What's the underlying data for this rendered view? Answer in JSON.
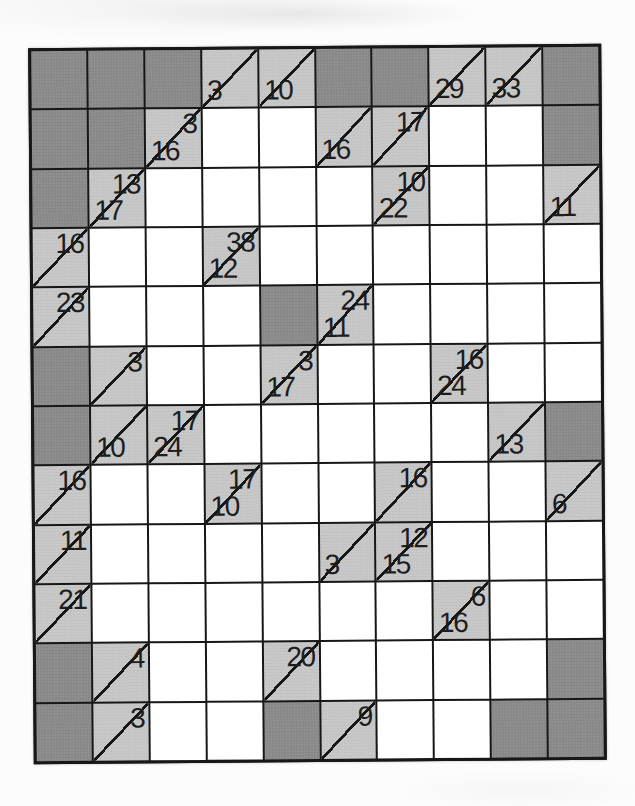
{
  "puzzle": {
    "type": "kakuro",
    "rows": 12,
    "cols": 10,
    "colors": {
      "block": "#8b8b8b",
      "clue": "#c7c7c7",
      "entry": "#ffffff",
      "line": "#171717",
      "number": "#1d1d1d",
      "page_bg": "#fcfcfc"
    },
    "legend": {
      "cell_types": {
        "b": "blocked",
        "w": "entry",
        "c": "clue"
      },
      "a": "across-clue (top-right of diagonal)",
      "d": "down-clue (bottom-left of diagonal)"
    },
    "cells": [
      [
        {
          "t": "b"
        },
        {
          "t": "b"
        },
        {
          "t": "b"
        },
        {
          "t": "c",
          "d": 3
        },
        {
          "t": "c",
          "d": 10
        },
        {
          "t": "b"
        },
        {
          "t": "b"
        },
        {
          "t": "c",
          "d": 29
        },
        {
          "t": "c",
          "d": 33
        },
        {
          "t": "b"
        }
      ],
      [
        {
          "t": "b"
        },
        {
          "t": "b"
        },
        {
          "t": "c",
          "a": 3,
          "d": 16
        },
        {
          "t": "w"
        },
        {
          "t": "w"
        },
        {
          "t": "c",
          "d": 16
        },
        {
          "t": "c",
          "a": 17
        },
        {
          "t": "w"
        },
        {
          "t": "w"
        },
        {
          "t": "b"
        }
      ],
      [
        {
          "t": "b"
        },
        {
          "t": "c",
          "a": 13,
          "d": 17
        },
        {
          "t": "w"
        },
        {
          "t": "w"
        },
        {
          "t": "w"
        },
        {
          "t": "w"
        },
        {
          "t": "c",
          "a": 10,
          "d": 22
        },
        {
          "t": "w"
        },
        {
          "t": "w"
        },
        {
          "t": "c",
          "d": 11
        }
      ],
      [
        {
          "t": "c",
          "a": 16
        },
        {
          "t": "w"
        },
        {
          "t": "w"
        },
        {
          "t": "c",
          "a": 38,
          "d": 12
        },
        {
          "t": "w"
        },
        {
          "t": "w"
        },
        {
          "t": "w"
        },
        {
          "t": "w"
        },
        {
          "t": "w"
        },
        {
          "t": "w"
        }
      ],
      [
        {
          "t": "c",
          "a": 23
        },
        {
          "t": "w"
        },
        {
          "t": "w"
        },
        {
          "t": "w"
        },
        {
          "t": "b"
        },
        {
          "t": "c",
          "a": 24,
          "d": 11
        },
        {
          "t": "w"
        },
        {
          "t": "w"
        },
        {
          "t": "w"
        },
        {
          "t": "w"
        }
      ],
      [
        {
          "t": "b"
        },
        {
          "t": "c",
          "a": 3
        },
        {
          "t": "w"
        },
        {
          "t": "w"
        },
        {
          "t": "c",
          "a": 3,
          "d": 17
        },
        {
          "t": "w"
        },
        {
          "t": "w"
        },
        {
          "t": "c",
          "a": 16,
          "d": 24
        },
        {
          "t": "w"
        },
        {
          "t": "w"
        }
      ],
      [
        {
          "t": "b"
        },
        {
          "t": "c",
          "d": 10
        },
        {
          "t": "c",
          "a": 17,
          "d": 24
        },
        {
          "t": "w"
        },
        {
          "t": "w"
        },
        {
          "t": "w"
        },
        {
          "t": "w"
        },
        {
          "t": "w"
        },
        {
          "t": "c",
          "d": 13
        },
        {
          "t": "b"
        }
      ],
      [
        {
          "t": "c",
          "a": 16
        },
        {
          "t": "w"
        },
        {
          "t": "w"
        },
        {
          "t": "c",
          "a": 17,
          "d": 10
        },
        {
          "t": "w"
        },
        {
          "t": "w"
        },
        {
          "t": "c",
          "a": 16
        },
        {
          "t": "w"
        },
        {
          "t": "w"
        },
        {
          "t": "c",
          "d": 6
        }
      ],
      [
        {
          "t": "c",
          "a": 11
        },
        {
          "t": "w"
        },
        {
          "t": "w"
        },
        {
          "t": "w"
        },
        {
          "t": "w"
        },
        {
          "t": "c",
          "d": 3
        },
        {
          "t": "c",
          "a": 12,
          "d": 15
        },
        {
          "t": "w"
        },
        {
          "t": "w"
        },
        {
          "t": "w"
        }
      ],
      [
        {
          "t": "c",
          "a": 21
        },
        {
          "t": "w"
        },
        {
          "t": "w"
        },
        {
          "t": "w"
        },
        {
          "t": "w"
        },
        {
          "t": "w"
        },
        {
          "t": "w"
        },
        {
          "t": "c",
          "a": 6,
          "d": 16
        },
        {
          "t": "w"
        },
        {
          "t": "w"
        }
      ],
      [
        {
          "t": "b"
        },
        {
          "t": "c",
          "a": 4
        },
        {
          "t": "w"
        },
        {
          "t": "w"
        },
        {
          "t": "c",
          "a": 20
        },
        {
          "t": "w"
        },
        {
          "t": "w"
        },
        {
          "t": "w"
        },
        {
          "t": "w"
        },
        {
          "t": "b"
        }
      ],
      [
        {
          "t": "b"
        },
        {
          "t": "c",
          "a": 3
        },
        {
          "t": "w"
        },
        {
          "t": "w"
        },
        {
          "t": "b"
        },
        {
          "t": "c",
          "a": 9
        },
        {
          "t": "w"
        },
        {
          "t": "w"
        },
        {
          "t": "b"
        },
        {
          "t": "b"
        }
      ]
    ]
  }
}
